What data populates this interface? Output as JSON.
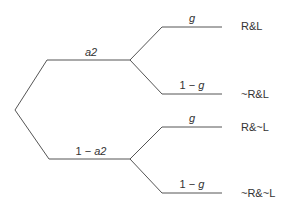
{
  "diagram": {
    "type": "probability-tree",
    "line_color": "#555555",
    "branches": {
      "upper": {
        "label_prefix": "",
        "label_var": "a2"
      },
      "lower": {
        "label_prefix": "1 − ",
        "label_var": "a2"
      }
    },
    "sub_branches": [
      {
        "label_prefix": "",
        "label_var": "g",
        "outcome": "R&L"
      },
      {
        "label_prefix": "1 − ",
        "label_var": "g",
        "outcome": "~R&L"
      },
      {
        "label_prefix": "",
        "label_var": "g",
        "outcome": "R&~L"
      },
      {
        "label_prefix": "1 − ",
        "label_var": "g",
        "outcome": "~R&~L"
      }
    ]
  }
}
